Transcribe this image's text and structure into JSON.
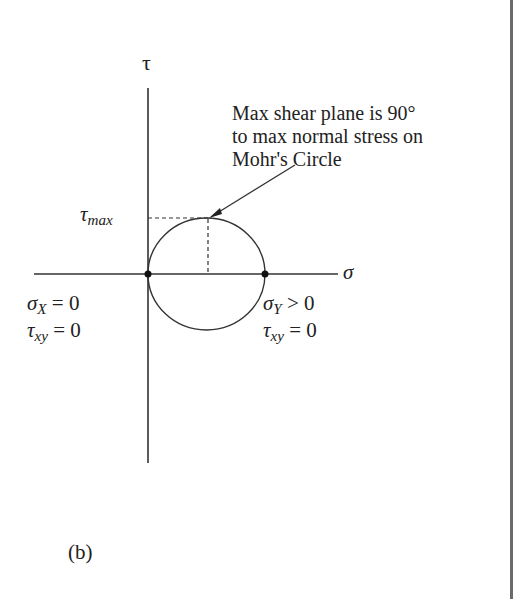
{
  "diagram": {
    "type": "mohrs_circle",
    "axes": {
      "vertical_label": "τ",
      "horizontal_label": "σ"
    },
    "annotation": {
      "lines": [
        "Max shear plane is 90°",
        "to max normal stress on",
        "Mohr's Circle"
      ]
    },
    "tau_max_label": {
      "symbol": "τ",
      "subscript": "max"
    },
    "left_point": {
      "line1": {
        "symbol": "σ",
        "subscript": "X",
        "rest": " = 0"
      },
      "line2": {
        "symbol": "τ",
        "subscript": "xy",
        "rest": " = 0"
      }
    },
    "right_point": {
      "line1": {
        "symbol": "σ",
        "subscript": "Y",
        "rest": " > 0"
      },
      "line2": {
        "symbol": "τ",
        "subscript": "xy",
        "rest": " = 0"
      }
    },
    "panel_label": "(b)",
    "colors": {
      "ink": "#222222",
      "border": "#6a6a6a",
      "background": "#ffffff"
    }
  }
}
